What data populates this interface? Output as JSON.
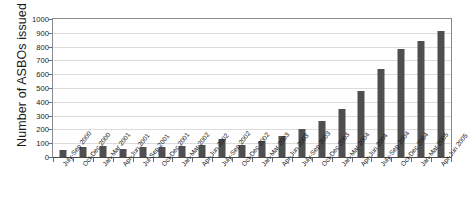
{
  "chart_data": {
    "type": "bar",
    "title": "",
    "xlabel": "",
    "ylabel": "Number of ASBOs issued",
    "ylim": [
      0,
      1000
    ],
    "ytick_step": 100,
    "yticks": [
      0,
      100,
      200,
      300,
      400,
      500,
      600,
      700,
      800,
      900,
      1000
    ],
    "grid": true,
    "legend": false,
    "bar_color": "#4f4f4f",
    "categories": [
      "July-Sep 2000",
      "Oct-Dec 2000",
      "Jan-Mar 2001",
      "Apr-Jun 2001",
      "Jul-Sep 2001",
      "Oct-Dec 2001",
      "Jan-Mar 2002",
      "Apr-Jun 2002",
      "July-Sep 2002",
      "Oct-Dec 2002",
      "Jan-Mar 2003",
      "Apr-Jun 2003",
      "July-Sep 2003",
      "Oct-Dec 2003",
      "Jan-Mar 2004",
      "Apr-Jun 2004",
      "July-Sep 2004",
      "Oct-Dec 2004",
      "Jan-Mar 2005",
      "Apr-Jun 2005"
    ],
    "values": [
      50,
      75,
      80,
      60,
      75,
      70,
      80,
      85,
      130,
      90,
      115,
      150,
      200,
      260,
      350,
      480,
      640,
      780,
      840,
      910
    ]
  }
}
